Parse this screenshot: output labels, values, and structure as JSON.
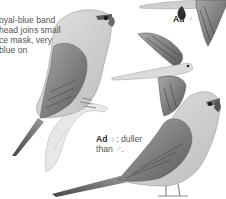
{
  "page": {
    "type": "field-guide-plate",
    "background": "#ffffff"
  },
  "intro_text": {
    "lines": [
      "oyal-blue band",
      "head joins small",
      "ce mask, very",
      "blue on"
    ]
  },
  "labels": {
    "male": {
      "age": "Ad",
      "sex_symbol": "♂",
      "note": ""
    },
    "female": {
      "age": "Ad",
      "sex_symbol": "♀",
      "note_line1": ": duller",
      "note_line2": "than",
      "note_symbol": "♂",
      "note_end": "."
    }
  },
  "illustrations": [
    {
      "name": "perched-bird-left",
      "description": "parrot perched on branch, facing right"
    },
    {
      "name": "flying-bird-top-right",
      "description": "partial bird in flight at top edge"
    },
    {
      "name": "flying-bird-middle",
      "description": "bird in flight, wings raised, long tail pointing left"
    },
    {
      "name": "perched-bird-bottom-right",
      "description": "adult female parrot standing, facing right"
    }
  ],
  "colors": {
    "caption_text": "#555555",
    "caption_bold": "#2a2a2a",
    "sex_symbol": "#b0b0b0",
    "plumage_light": "#d4d4d4",
    "plumage_mid": "#9a9a9a",
    "plumage_dark": "#4a4a4a"
  }
}
